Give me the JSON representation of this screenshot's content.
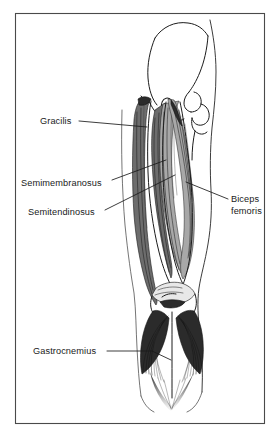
{
  "figure": {
    "view": "posterior",
    "style": "black and white line drawing with hatched shading",
    "background_color": "#ffffff",
    "ink_color": "#1a1a1a",
    "frame": {
      "name": "figure-border",
      "x": 15,
      "y": 13,
      "width": 250,
      "height": 411,
      "stroke_color": "#4a4a4a"
    }
  },
  "labels": [
    {
      "id": "gracilis",
      "text": "Gracilis",
      "text_x": 40,
      "text_y": 124,
      "anchor": "start",
      "lines": 1
    },
    {
      "id": "semimembranosus",
      "text": "Semimembranosus",
      "text_x": 21,
      "text_y": 186,
      "anchor": "start",
      "lines": 1
    },
    {
      "id": "semitendinosus",
      "text": "Semitendinosus",
      "text_x": 28,
      "text_y": 215,
      "anchor": "start",
      "lines": 1
    },
    {
      "id": "biceps-femoris",
      "text_line1": "Biceps",
      "text_line2": "femoris",
      "text_x": 231,
      "text_y": 202,
      "anchor": "start",
      "lines": 2
    },
    {
      "id": "gastrocnemius",
      "text": "Gastrocnemius",
      "text_x": 33,
      "text_y": 354,
      "anchor": "start",
      "lines": 1
    }
  ],
  "anatomy": {
    "structures": [
      "ilium",
      "obturator foramen",
      "ischial tuberosity",
      "femoral head",
      "greater trochanter",
      "gracilis",
      "semimembranosus",
      "semitendinosus",
      "biceps femoris",
      "popliteal fossa",
      "gastrocnemius medial head",
      "gastrocnemius lateral head",
      "calcaneal tendon"
    ]
  }
}
